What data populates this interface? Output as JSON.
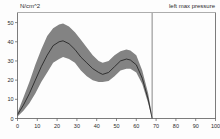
{
  "header": {
    "y_axis_unit": "N/cm^2",
    "series_label": "left max pressure"
  },
  "colors": {
    "band": "#838383",
    "mean_line": "#1c1c1c",
    "axis": "#5a5a5a",
    "divider": "#6b6b6b",
    "background": "#fdfdfd",
    "text": "#2b2b2b"
  },
  "axes": {
    "x_ticks": [
      "0",
      "10",
      "20",
      "30",
      "40",
      "50",
      "60",
      "70",
      "80",
      "90",
      "100"
    ],
    "y_ticks": [
      "0",
      "10",
      "20",
      "30",
      "40",
      "50"
    ]
  },
  "chart_data": {
    "type": "line",
    "title": "",
    "subtitle": "",
    "xlabel": "",
    "ylabel": "N/cm^2",
    "xlim": [
      0,
      100
    ],
    "ylim": [
      0,
      55
    ],
    "grid": false,
    "legend_position": "top-right",
    "annotations": [
      {
        "name": "data-end-divider",
        "type": "vline",
        "x": 68,
        "label": ""
      }
    ],
    "x": [
      0,
      3,
      6,
      9,
      12,
      15,
      18,
      21,
      23,
      26,
      29,
      32,
      35,
      38,
      41,
      43,
      46,
      49,
      52,
      55,
      57,
      60,
      63,
      66,
      68
    ],
    "series": [
      {
        "name": "left max pressure (mean)",
        "values": [
          2,
          7,
          13,
          20,
          27,
          33,
          38,
          40,
          40.5,
          39,
          36,
          32,
          29,
          26,
          24,
          23,
          24,
          27,
          30,
          31,
          30.5,
          28,
          21,
          10,
          0
        ]
      },
      {
        "name": "upper bound (+1 SD)",
        "values": [
          3,
          11,
          19,
          28,
          36,
          43,
          47,
          49,
          49.5,
          48,
          45,
          41,
          37,
          33,
          30,
          29,
          30,
          33,
          35,
          36,
          35.5,
          33,
          25,
          13,
          1
        ]
      },
      {
        "name": "lower bound (-1 SD)",
        "values": [
          1,
          4,
          8,
          13,
          19,
          24,
          29,
          31,
          32,
          31,
          29,
          25,
          22,
          20,
          19,
          19,
          19.5,
          22,
          25,
          26,
          26,
          24,
          18,
          8,
          0
        ]
      }
    ]
  }
}
